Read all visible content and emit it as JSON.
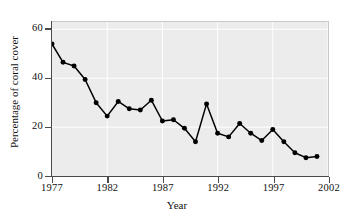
{
  "chart_data": {
    "type": "line",
    "title": "",
    "xlabel": "Year",
    "ylabel": "Percentage of coral cover",
    "xlim": [
      1977,
      2002
    ],
    "ylim": [
      0,
      63
    ],
    "xticks": [
      1977,
      1982,
      1987,
      1992,
      1997,
      2002
    ],
    "yticks": [
      0,
      20,
      40,
      60
    ],
    "grid": true,
    "legend": "none",
    "marker": "filled-circle",
    "line_color": "#000000",
    "marker_color": "#000000",
    "plot_background": "#ececec",
    "gridline_color": "#ffffff",
    "x": [
      1977,
      1978,
      1979,
      1980,
      1981,
      1982,
      1983,
      1984,
      1985,
      1986,
      1987,
      1988,
      1989,
      1990,
      1991,
      1992,
      1993,
      1994,
      1995,
      1996,
      1997,
      1998,
      1999,
      2000,
      2001
    ],
    "values": [
      54,
      46.5,
      45,
      39.5,
      30,
      24.5,
      30.5,
      27.5,
      27,
      31,
      22.5,
      23,
      19.5,
      14,
      29.5,
      17.5,
      16,
      21.5,
      17.5,
      14.5,
      19,
      14,
      9.5,
      7.5,
      8
    ]
  },
  "axis": {
    "y_tick_labels": [
      "0",
      "20",
      "40",
      "60"
    ],
    "x_tick_labels": [
      "1977",
      "1982",
      "1987",
      "1992",
      "1997",
      "2002"
    ],
    "x_title": "Year",
    "y_title": "Percentage of coral cover"
  }
}
